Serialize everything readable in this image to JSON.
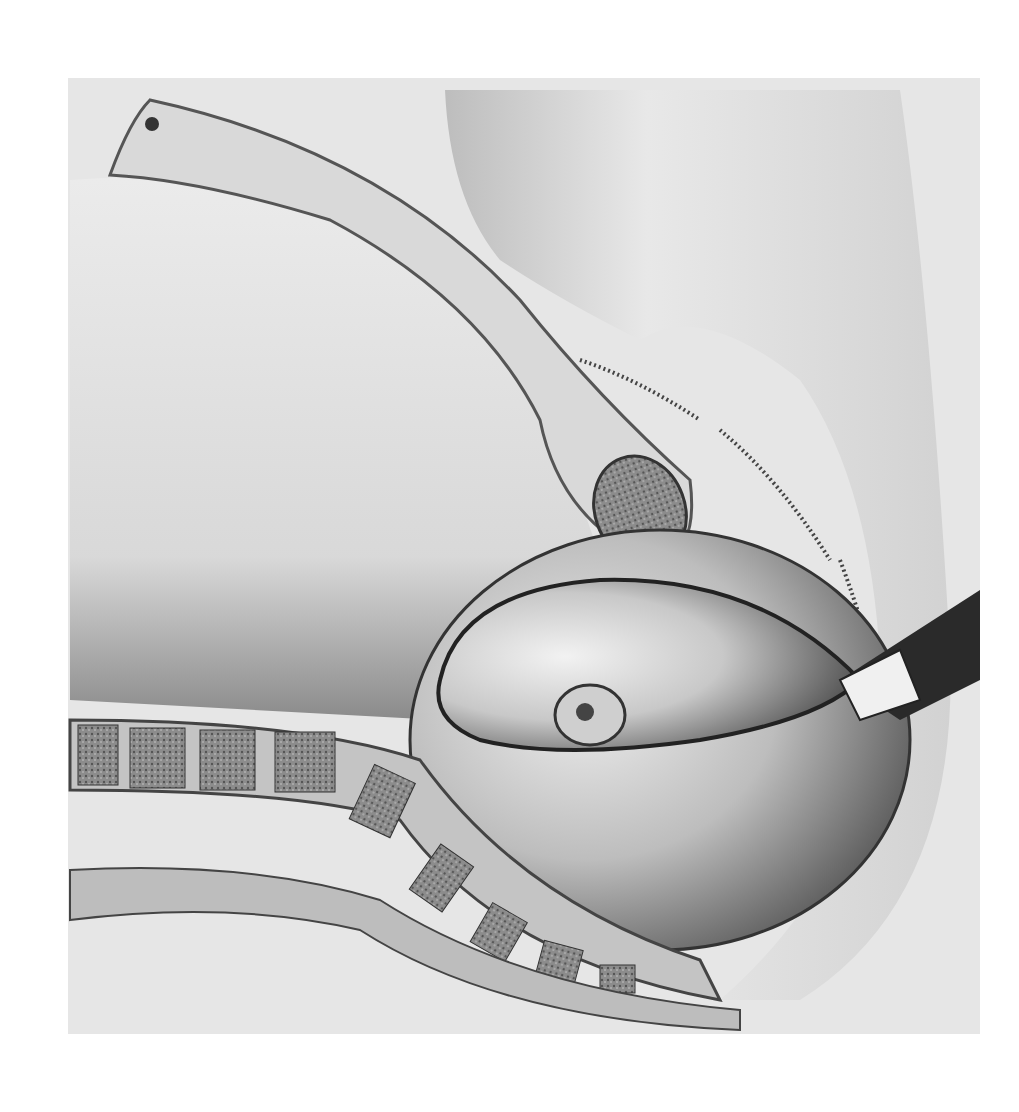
{
  "image": {
    "kind": "anatomical-illustration",
    "style": "grayscale pencil drawing",
    "subject": "sagittal pelvic cross-section with fetal head and instrument",
    "background": "#ffffff",
    "paper": "#e6e6e6",
    "ink_dark": "#2a2a2a",
    "ink_mid": "#8a8a8a"
  }
}
